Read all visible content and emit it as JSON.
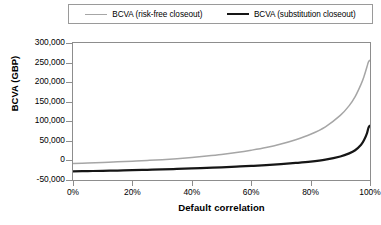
{
  "chart_data": {
    "type": "line",
    "title": "",
    "xlabel": "Default correlation",
    "ylabel": "BCVA (GBP)",
    "xlim": [
      0,
      100
    ],
    "ylim": [
      -50000,
      300000
    ],
    "grid": false,
    "legend_position": "top",
    "x_tick_labels": [
      "0%",
      "20%",
      "40%",
      "60%",
      "80%",
      "100%"
    ],
    "x_ticks": [
      0,
      20,
      40,
      60,
      80,
      100
    ],
    "y_tick_labels": [
      "-50,000",
      "0",
      "50,000",
      "100,000",
      "150,000",
      "200,000",
      "250,000",
      "300,000"
    ],
    "y_ticks": [
      -50000,
      0,
      50000,
      100000,
      150000,
      200000,
      250000,
      300000
    ],
    "x": [
      0,
      5,
      10,
      15,
      20,
      25,
      30,
      35,
      40,
      45,
      50,
      55,
      60,
      65,
      70,
      75,
      80,
      85,
      90,
      93,
      95,
      97,
      98,
      99,
      99.5,
      100
    ],
    "series": [
      {
        "name": "BCVA (risk-free closeout)",
        "color": "#a6a6a6",
        "values": [
          -8000,
          -6500,
          -5000,
          -3500,
          -1800,
          0,
          2000,
          4500,
          7500,
          11000,
          15000,
          20000,
          26000,
          33000,
          42000,
          53000,
          67000,
          86000,
          115000,
          140000,
          163000,
          195000,
          215000,
          240000,
          252000,
          256000
        ]
      },
      {
        "name": "BCVA (substitution closeout)",
        "color": "#161616",
        "values": [
          -28000,
          -27300,
          -26600,
          -25800,
          -25000,
          -24000,
          -23000,
          -21800,
          -20500,
          -19000,
          -17500,
          -15800,
          -14000,
          -12000,
          -9500,
          -6500,
          -3000,
          2000,
          10000,
          18000,
          26000,
          40000,
          52000,
          70000,
          84000,
          89000
        ]
      }
    ]
  }
}
